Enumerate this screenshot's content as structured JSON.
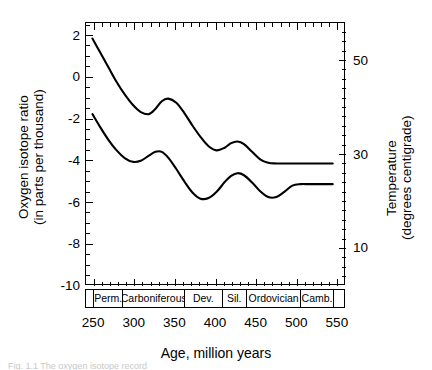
{
  "figure": {
    "xlabel": "Age, million years",
    "ylabel_left_line1": "Oxygen isotope ratio",
    "ylabel_left_line2": "(in parts per thousand)",
    "ylabel_right_line1": "Temperature",
    "ylabel_right_line2": "(degrees centigrade)",
    "caption": "Fig. 1.1  The oxygen isotope record"
  },
  "chart_data": {
    "type": "line",
    "title": "",
    "xlabel": "Age, million years",
    "ylabel": "Oxygen isotope ratio (in parts per thousand)",
    "ylabel_secondary": "Temperature (degrees centigrade)",
    "xlim": [
      240,
      560
    ],
    "ylim": [
      -10,
      2.6
    ],
    "ylim_secondary": [
      58,
      2
    ],
    "grid": false,
    "legend": "none",
    "x_ticks": [
      250,
      300,
      350,
      400,
      450,
      500,
      550
    ],
    "x_tick_labels": [
      "250",
      "300",
      "350",
      "400",
      "450",
      "500",
      "550"
    ],
    "x_minor_step": 10,
    "y_ticks": [
      2,
      0,
      -2,
      -4,
      -6,
      -8,
      -10
    ],
    "y_tick_labels": [
      "2",
      "0",
      "-2",
      "-4",
      "-6",
      "-8",
      "-10"
    ],
    "y_minor_step": 0.5,
    "y_ticks_secondary": [
      10,
      30,
      50
    ],
    "y_tick_labels_secondary": [
      "10",
      "30",
      "50"
    ],
    "series": [
      {
        "name": "upper envelope",
        "color": "#000000",
        "x": [
          248,
          258,
          268,
          278,
          288,
          298,
          308,
          318,
          326,
          334,
          342,
          352,
          362,
          372,
          382,
          392,
          402,
          412,
          420,
          428,
          436,
          446,
          456,
          466,
          476,
          486,
          496,
          506,
          516,
          526,
          536,
          546
        ],
        "y": [
          1.85,
          1.15,
          0.45,
          -0.25,
          -0.85,
          -1.35,
          -1.7,
          -1.8,
          -1.55,
          -1.18,
          -1.05,
          -1.25,
          -1.75,
          -2.35,
          -2.9,
          -3.35,
          -3.55,
          -3.42,
          -3.2,
          -3.12,
          -3.25,
          -3.62,
          -3.98,
          -4.15,
          -4.18,
          -4.18,
          -4.18,
          -4.18,
          -4.18,
          -4.18,
          -4.18,
          -4.18
        ]
      },
      {
        "name": "lower envelope",
        "color": "#000000",
        "x": [
          248,
          258,
          268,
          278,
          288,
          298,
          308,
          318,
          326,
          334,
          342,
          352,
          362,
          372,
          382,
          392,
          402,
          412,
          420,
          428,
          436,
          446,
          456,
          466,
          476,
          486,
          496,
          506,
          516,
          526,
          536,
          546
        ],
        "y": [
          -1.8,
          -2.45,
          -3.05,
          -3.55,
          -3.92,
          -4.1,
          -4.05,
          -3.8,
          -3.62,
          -3.62,
          -3.9,
          -4.45,
          -5.05,
          -5.58,
          -5.88,
          -5.85,
          -5.55,
          -5.08,
          -4.78,
          -4.65,
          -4.75,
          -5.1,
          -5.52,
          -5.8,
          -5.8,
          -5.55,
          -5.25,
          -5.18,
          -5.18,
          -5.18,
          -5.18,
          -5.18
        ]
      }
    ],
    "period_bar": [
      {
        "label": "",
        "start": 240,
        "end": 250
      },
      {
        "label": "Perm.",
        "start": 250,
        "end": 286
      },
      {
        "label": "Carboniferous",
        "start": 286,
        "end": 362
      },
      {
        "label": "Dev.",
        "start": 362,
        "end": 408
      },
      {
        "label": "Sil.",
        "start": 408,
        "end": 438
      },
      {
        "label": "Ordovician",
        "start": 438,
        "end": 505
      },
      {
        "label": "Camb.",
        "start": 505,
        "end": 545
      },
      {
        "label": "",
        "start": 545,
        "end": 560
      }
    ]
  }
}
